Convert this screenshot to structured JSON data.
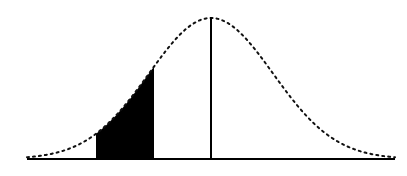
{
  "diagram": {
    "type": "normal-distribution",
    "curve": {
      "center_x": 211,
      "peak_y": 18,
      "baseline_y": 159,
      "sigma_px": 62,
      "x_start": 27,
      "x_end": 395,
      "style": "dotted",
      "color": "#111111"
    },
    "shaded_region": {
      "x_from": 96,
      "x_to": 154,
      "z_from": -1.85,
      "z_to": -0.92,
      "color": "#000000"
    },
    "mean_line": {
      "x": 211,
      "color": "#000000"
    },
    "baseline": {
      "x1": 27,
      "x2": 395,
      "color": "#000000"
    }
  }
}
